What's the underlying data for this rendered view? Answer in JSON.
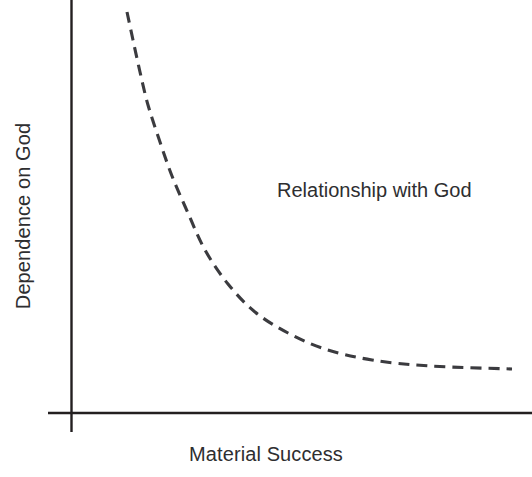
{
  "figure": {
    "background_color": "#ffffff",
    "width": 532,
    "height": 477
  },
  "chart_data": {
    "type": "line",
    "title": "",
    "subtitle": "",
    "xlabel": "Material Success",
    "ylabel": "Dependence on God",
    "grid": false,
    "legend": null,
    "axes": {
      "x_tick_labels": [],
      "y_tick_labels": [],
      "xlim": [
        0,
        1
      ],
      "ylim": [
        0,
        1
      ],
      "axis_color": "#231f20",
      "x_axis_pixel_y": 413,
      "y_axis_pixel_x": 71
    },
    "series": [
      {
        "name": "Dependence on God vs Material Success",
        "style": "dashed",
        "color": "#3b3b3f",
        "dash_pattern": "11 7",
        "line_width": 3.1,
        "description": "Monotonically decreasing convex (hyperbolic / inverse) curve approaching a horizontal asymptote near the bottom right.",
        "x": [
          0.145,
          0.175,
          0.21,
          0.25,
          0.3,
          0.36,
          0.43,
          0.5,
          0.58,
          0.66,
          0.74,
          0.82,
          0.9,
          0.96,
          1.0
        ],
        "y": [
          0.97,
          0.86,
          0.76,
          0.66,
          0.56,
          0.47,
          0.39,
          0.32,
          0.26,
          0.21,
          0.17,
          0.14,
          0.12,
          0.11,
          0.105
        ],
        "pixel_points": [
          [
            127,
            12
          ],
          [
            133,
            40
          ],
          [
            140,
            72
          ],
          [
            148,
            105
          ],
          [
            159,
            139
          ],
          [
            172,
            176
          ],
          [
            188,
            213
          ],
          [
            205,
            250
          ],
          [
            228,
            284
          ],
          [
            255,
            312
          ],
          [
            288,
            333
          ],
          [
            325,
            349
          ],
          [
            372,
            360
          ],
          [
            430,
            366
          ],
          [
            512,
            369
          ]
        ]
      }
    ],
    "annotations": [
      {
        "text": "Relationship with God",
        "pixel_x": 277,
        "pixel_y": 179,
        "color": "#2e2e30",
        "font_size": 20
      }
    ]
  },
  "labels": {
    "y_axis": "Dependence on God",
    "x_axis": "Material Success",
    "annotation": "Relationship with God"
  },
  "colors": {
    "axis": "#231f20",
    "curve": "#3b3b3f",
    "text": "#2e2e30",
    "background": "#ffffff"
  }
}
